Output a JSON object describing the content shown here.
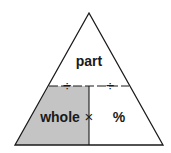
{
  "diagram": {
    "labels": {
      "top": "part",
      "bottom_left": "whole",
      "bottom_right": "%"
    },
    "operators": {
      "divide_left": "÷",
      "divide_right": "÷",
      "multiply": "×"
    },
    "colors": {
      "shaded": "#c4c4c4",
      "stroke": "#1a1a1a",
      "background": "#ffffff"
    }
  }
}
